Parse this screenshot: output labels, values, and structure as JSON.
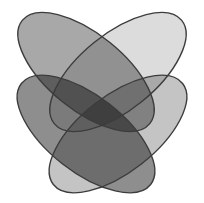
{
  "diagram": {
    "type": "venn-4-ellipses",
    "background": "#ffffff",
    "outline_color": "#3c3c3c",
    "sets": [
      {
        "id": "A",
        "position": "upper-left",
        "fill": "#a8a8a8",
        "cx": 86,
        "cy": 72,
        "rx": 82,
        "ry": 38,
        "rotate": 39
      },
      {
        "id": "B",
        "position": "upper-right",
        "fill": "#dcdcdc",
        "cx": 118,
        "cy": 72,
        "rx": 82,
        "ry": 38,
        "rotate": -39
      },
      {
        "id": "C",
        "position": "lower-left",
        "fill": "#8e8e8e",
        "cx": 86,
        "cy": 134,
        "rx": 82,
        "ry": 38,
        "rotate": 38
      },
      {
        "id": "D",
        "position": "lower-right",
        "fill": "#c4c4c4",
        "cx": 118,
        "cy": 134,
        "rx": 82,
        "ry": 38,
        "rotate": -38
      }
    ]
  }
}
